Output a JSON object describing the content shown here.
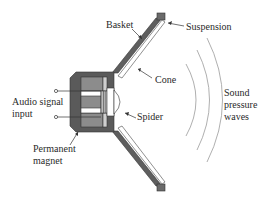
{
  "diagram": {
    "type": "labeled cross-section",
    "labels": {
      "basket": "Basket",
      "suspension": "Suspension",
      "cone": "Cone",
      "sound_line1": "Sound",
      "sound_line2": "pressure",
      "sound_line3": "waves",
      "audio_line1": "Audio signal",
      "audio_line2": "input",
      "spider": "Spider",
      "magnet_line1": "Permanent",
      "magnet_line2": "magnet"
    },
    "components": [
      "Basket",
      "Suspension",
      "Cone",
      "Spider",
      "Permanent magnet",
      "Audio signal input",
      "Sound pressure waves"
    ],
    "colors": {
      "ink": "#2a2a2a",
      "dark_fill": "#5a5a5a",
      "mid_fill": "#8c8c8c",
      "light_fill": "#bdbdbd",
      "wave": "#9a9a9a"
    }
  }
}
